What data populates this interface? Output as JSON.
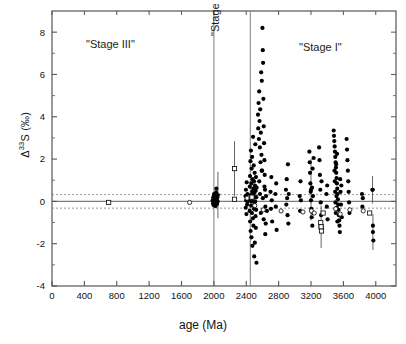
{
  "chart_data": {
    "type": "scatter",
    "title": "",
    "xlabel": "age (Ma)",
    "ylabel": "Δ33S (‰)",
    "ylabel_base": "Δ",
    "ylabel_sup": "33",
    "ylabel_rest": "S (‰)",
    "xlim": [
      0,
      4250
    ],
    "ylim": [
      -4,
      9
    ],
    "xticks": [
      0,
      400,
      800,
      1200,
      1600,
      2000,
      2400,
      2800,
      3200,
      3600,
      4000
    ],
    "xtick_labels": [
      "0",
      "400",
      "800",
      "1200",
      "1600",
      "2000",
      "2400",
      "2800",
      "3200",
      "3600",
      "4000"
    ],
    "yticks": [
      -4,
      -2,
      0,
      2,
      4,
      6,
      8
    ],
    "ytick_labels": [
      "-4",
      "-2",
      "0",
      "2",
      "4",
      "6",
      "8"
    ],
    "yminor": [
      -3,
      -1,
      1,
      3,
      5,
      7
    ],
    "grid": false,
    "legend": null,
    "reference_lines": {
      "zero_line": 0,
      "dashed_upper": 0.32,
      "dashed_lower": -0.32,
      "dashed_color": "#8a8a8a",
      "zero_color": "#7d7d7d"
    },
    "dividers": [
      {
        "x": 2000,
        "label": "\"Stage III\"/\"Stage II\" boundary"
      },
      {
        "x": 2450,
        "label": "\"Stage II\"/\"Stage I\" boundary"
      }
    ],
    "annotations": [
      {
        "text": "\"Stage III\"",
        "x": 1050,
        "y": 7.0,
        "rotation": 0
      },
      {
        "text": "\"Stage II\"",
        "x": 2230,
        "y": 6.0,
        "rotation": -90
      },
      {
        "text": "\"Stage I\"",
        "x": 3150,
        "y": 6.7,
        "rotation": 0
      }
    ],
    "marker_styles": {
      "filled_circle": "#000000",
      "open_circle": "#ffffff",
      "open_square": "#ffffff",
      "edge": "#111111",
      "errorbar": "#555555"
    },
    "series": [
      {
        "name": "filled circles",
        "marker": "filled_circle",
        "points": [
          [
            1985,
            0.05
          ],
          [
            1990,
            -0.1
          ],
          [
            1993,
            0.2
          ],
          [
            1996,
            0.0
          ],
          [
            1999,
            -0.18
          ],
          [
            2002,
            0.35
          ],
          [
            2005,
            0.1
          ],
          [
            2008,
            -0.05
          ],
          [
            2011,
            0.28
          ],
          [
            2014,
            0.0
          ],
          [
            2017,
            0.15
          ],
          [
            2020,
            -0.22
          ],
          [
            2023,
            0.08
          ],
          [
            2027,
            0.42
          ],
          [
            2031,
            0.6
          ],
          [
            2035,
            0.05
          ],
          [
            2039,
            -0.12
          ],
          [
            2043,
            0.18
          ],
          [
            2047,
            0.0
          ],
          [
            2390,
            0.25
          ],
          [
            2393,
            -0.3
          ],
          [
            2396,
            0.55
          ],
          [
            2399,
            0.05
          ],
          [
            2402,
            -0.6
          ],
          [
            2405,
            0.9
          ],
          [
            2408,
            0.1
          ],
          [
            2411,
            -0.15
          ],
          [
            2414,
            0.35
          ],
          [
            2417,
            0.0
          ],
          [
            2440,
            0.1
          ],
          [
            2442,
            -0.45
          ],
          [
            2444,
            0.7
          ],
          [
            2446,
            1.2
          ],
          [
            2448,
            -0.95
          ],
          [
            2450,
            0.05
          ],
          [
            2452,
            1.9
          ],
          [
            2454,
            -1.4
          ],
          [
            2456,
            0.3
          ],
          [
            2458,
            2.4
          ],
          [
            2460,
            -0.2
          ],
          [
            2462,
            0.85
          ],
          [
            2464,
            -1.7
          ],
          [
            2466,
            1.55
          ],
          [
            2468,
            0.0
          ],
          [
            2470,
            -0.55
          ],
          [
            2472,
            2.1
          ],
          [
            2474,
            0.45
          ],
          [
            2476,
            -2.1
          ],
          [
            2478,
            1.05
          ],
          [
            2480,
            0.15
          ],
          [
            2482,
            -0.8
          ],
          [
            2484,
            3.05
          ],
          [
            2486,
            0.6
          ],
          [
            2488,
            -1.15
          ],
          [
            2490,
            0.25
          ],
          [
            2492,
            1.7
          ],
          [
            2494,
            -0.35
          ],
          [
            2496,
            0.95
          ],
          [
            2498,
            -2.6
          ],
          [
            2500,
            0.4
          ],
          [
            2502,
            -0.05
          ],
          [
            2504,
            1.35
          ],
          [
            2506,
            -1.95
          ],
          [
            2508,
            0.75
          ],
          [
            2510,
            0.0
          ],
          [
            2512,
            2.7
          ],
          [
            2514,
            -0.7
          ],
          [
            2516,
            0.5
          ],
          [
            2518,
            -1.25
          ],
          [
            2520,
            1.15
          ],
          [
            2522,
            -0.4
          ],
          [
            2524,
            0.2
          ],
          [
            2526,
            -2.9
          ],
          [
            2528,
            0.65
          ],
          [
            2545,
            4.1
          ],
          [
            2548,
            3.45
          ],
          [
            2552,
            4.65
          ],
          [
            2556,
            2.95
          ],
          [
            2560,
            5.2
          ],
          [
            2564,
            3.8
          ],
          [
            2568,
            2.55
          ],
          [
            2572,
            4.35
          ],
          [
            2576,
            1.85
          ],
          [
            2580,
            3.25
          ],
          [
            2584,
            6.1
          ],
          [
            2588,
            2.2
          ],
          [
            2592,
            5.7
          ],
          [
            2596,
            1.45
          ],
          [
            2600,
            8.2
          ],
          [
            2604,
            7.15
          ],
          [
            2608,
            6.55
          ],
          [
            2612,
            4.85
          ],
          [
            2616,
            3.55
          ],
          [
            2620,
            2.75
          ],
          [
            2624,
            1.95
          ],
          [
            2628,
            1.25
          ],
          [
            2632,
            0.55
          ],
          [
            2636,
            -0.25
          ],
          [
            2640,
            -1.05
          ],
          [
            2560,
            0.95
          ],
          [
            2570,
            0.35
          ],
          [
            2580,
            -0.55
          ],
          [
            2590,
            1.45
          ],
          [
            2605,
            0.15
          ],
          [
            2615,
            -0.85
          ],
          [
            2625,
            0.7
          ],
          [
            2635,
            -1.55
          ],
          [
            2645,
            0.25
          ],
          [
            2655,
            -0.45
          ],
          [
            2700,
            0.45
          ],
          [
            2705,
            -0.35
          ],
          [
            2710,
            1.15
          ],
          [
            2715,
            0.05
          ],
          [
            2720,
            -0.95
          ],
          [
            2760,
            0.35
          ],
          [
            2765,
            -0.25
          ],
          [
            2770,
            0.85
          ],
          [
            2775,
            -1.35
          ],
          [
            2890,
            0.55
          ],
          [
            2895,
            -0.15
          ],
          [
            2900,
            1.05
          ],
          [
            2905,
            0.15
          ],
          [
            2910,
            -0.65
          ],
          [
            2915,
            1.75
          ],
          [
            2920,
            -1.05
          ],
          [
            2925,
            0.35
          ],
          [
            3060,
            0.25
          ],
          [
            3065,
            -0.45
          ],
          [
            3070,
            0.95
          ],
          [
            3075,
            0.05
          ],
          [
            3180,
            2.35
          ],
          [
            3184,
            1.85
          ],
          [
            3188,
            1.35
          ],
          [
            3192,
            0.85
          ],
          [
            3196,
            0.45
          ],
          [
            3200,
            0.05
          ],
          [
            3204,
            -0.35
          ],
          [
            3208,
            -0.75
          ],
          [
            3212,
            0.65
          ],
          [
            3216,
            -1.15
          ],
          [
            3220,
            1.55
          ],
          [
            3224,
            0.25
          ],
          [
            3228,
            -0.55
          ],
          [
            3232,
            2.05
          ],
          [
            3300,
            2.55
          ],
          [
            3305,
            1.95
          ],
          [
            3310,
            1.25
          ],
          [
            3315,
            0.55
          ],
          [
            3320,
            -0.05
          ],
          [
            3325,
            -0.65
          ],
          [
            3330,
            0.95
          ],
          [
            3335,
            -1.25
          ],
          [
            3390,
            0.35
          ],
          [
            3395,
            -0.25
          ],
          [
            3400,
            0.75
          ],
          [
            3405,
            -0.85
          ],
          [
            3480,
            3.35
          ],
          [
            3484,
            3.1
          ],
          [
            3488,
            2.85
          ],
          [
            3492,
            2.6
          ],
          [
            3496,
            2.35
          ],
          [
            3500,
            2.1
          ],
          [
            3504,
            1.85
          ],
          [
            3508,
            1.6
          ],
          [
            3512,
            1.35
          ],
          [
            3516,
            1.1
          ],
          [
            3520,
            0.85
          ],
          [
            3524,
            0.6
          ],
          [
            3528,
            0.35
          ],
          [
            3532,
            0.1
          ],
          [
            3536,
            -0.15
          ],
          [
            3540,
            -0.4
          ],
          [
            3544,
            -0.65
          ],
          [
            3548,
            -0.9
          ],
          [
            3552,
            -1.15
          ],
          [
            3556,
            -1.45
          ],
          [
            3490,
            1.45
          ],
          [
            3494,
            0.95
          ],
          [
            3498,
            0.45
          ],
          [
            3502,
            -0.05
          ],
          [
            3506,
            -0.55
          ],
          [
            3510,
            1.75
          ],
          [
            3514,
            0.25
          ],
          [
            3518,
            -0.3
          ],
          [
            3522,
            2.25
          ],
          [
            3526,
            -0.95
          ],
          [
            3560,
            1.05
          ],
          [
            3565,
            0.45
          ],
          [
            3570,
            -0.15
          ],
          [
            3575,
            0.75
          ],
          [
            3580,
            -0.75
          ],
          [
            3640,
            2.95
          ],
          [
            3645,
            2.45
          ],
          [
            3650,
            1.95
          ],
          [
            3655,
            1.45
          ],
          [
            3660,
            0.95
          ],
          [
            3665,
            0.45
          ],
          [
            3670,
            -0.05
          ],
          [
            3675,
            -0.55
          ],
          [
            3830,
            0.35
          ],
          [
            3835,
            -0.25
          ],
          [
            3840,
            0.15
          ],
          [
            3960,
            0.55
          ],
          [
            3965,
            -1.15
          ],
          [
            3970,
            -1.85
          ]
        ]
      },
      {
        "name": "open circles",
        "marker": "open_circle",
        "points": [
          [
            1700,
            -0.05
          ],
          [
            2410,
            0.15
          ],
          [
            2505,
            -0.2
          ],
          [
            2610,
            -0.4
          ],
          [
            2830,
            -0.45
          ],
          [
            3100,
            -0.5
          ],
          [
            3205,
            -0.45
          ],
          [
            3240,
            -0.55
          ],
          [
            3505,
            -0.35
          ],
          [
            3560,
            -0.6
          ],
          [
            3680,
            -0.4
          ],
          [
            3845,
            -0.45
          ]
        ]
      },
      {
        "name": "open squares",
        "marker": "open_square",
        "points": [
          [
            700,
            -0.05
          ],
          [
            2255,
            0.1
          ],
          [
            2470,
            0.2
          ],
          [
            3320,
            -1.0
          ],
          [
            3325,
            -1.2
          ],
          [
            3330,
            -1.4
          ],
          [
            3350,
            -0.55
          ],
          [
            3925,
            -0.55
          ]
        ]
      }
    ],
    "errorbars": [
      {
        "x": 2255,
        "y": 1.55,
        "yerr": 1.3,
        "marker": "open_square"
      },
      {
        "x": 3200,
        "y": 0.55,
        "yerr": 1.45,
        "marker": "filled_circle"
      },
      {
        "x": 3325,
        "y": -1.2,
        "yerr": 1.0,
        "marker": "open_square"
      },
      {
        "x": 3960,
        "y": 0.55,
        "yerr": 0.65,
        "marker": "filled_circle"
      },
      {
        "x": 3965,
        "y": -1.45,
        "yerr": 0.85,
        "marker": "filled_circle"
      },
      {
        "x": 2050,
        "y": 0.3,
        "yerr": 1.1,
        "marker": "filled_circle"
      }
    ]
  },
  "axes": {
    "x_axis_label": "age (Ma)",
    "y_axis_label_base": "Δ",
    "y_axis_label_sup": "33",
    "y_axis_label_rest": "S (‰)"
  },
  "stages": {
    "stage_three": "\"Stage III\"",
    "stage_two": "\"Stage II\"",
    "stage_one": "\"Stage I\""
  }
}
